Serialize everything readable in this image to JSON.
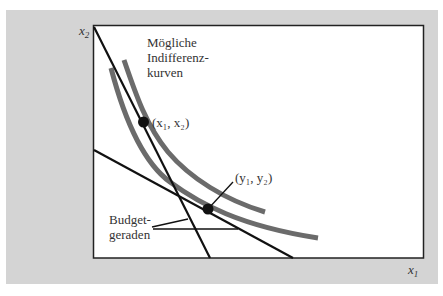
{
  "diagram": {
    "type": "indifference-curves-budget-lines",
    "axes": {
      "x_label": "x",
      "x_sub": "1",
      "y_label": "x",
      "y_sub": "2"
    },
    "annotations": {
      "curves_label_line1": "Mögliche",
      "curves_label_line2": "Indifferenz-",
      "curves_label_line3": "kurven",
      "point1_label": "(x₁, x₂)",
      "point2_label": "(y₁, y₂)",
      "budget_label_line1": "Budget-",
      "budget_label_line2": "geraden"
    },
    "colors": {
      "background_panel": "#d4d4d4",
      "plot_area": "#ffffff",
      "curves": "#6b6b6b",
      "lines": "#111111",
      "text": "#333333"
    }
  }
}
